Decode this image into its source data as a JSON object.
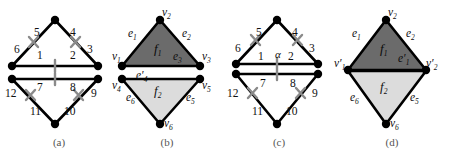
{
  "figure": {
    "width": 450,
    "height": 152,
    "background": "#ffffff"
  },
  "colors": {
    "edge_stroke": "#000000",
    "vertex_fill": "#000000",
    "tick_mark": "#808080",
    "face_f1_fill": "#6b6b6b",
    "face_f2_fill": "#dcdcdc",
    "caption_text": "#555555",
    "label_text": "#111111",
    "background": "#ffffff"
  },
  "panels": [
    {
      "id": "a",
      "caption": "(a)",
      "kind": "numbered-half-edges",
      "vertices": [
        {
          "name": "top",
          "x": 55,
          "y": 20
        },
        {
          "name": "left-upper",
          "x": 12,
          "y": 66
        },
        {
          "name": "right-upper",
          "x": 98,
          "y": 66
        },
        {
          "name": "left-lower",
          "x": 12,
          "y": 78
        },
        {
          "name": "right-lower",
          "x": 98,
          "y": 78
        },
        {
          "name": "bottom",
          "x": 55,
          "y": 124
        }
      ],
      "edge_labels": [
        {
          "text": "5",
          "x": 34,
          "y": 33
        },
        {
          "text": "4",
          "x": 70,
          "y": 33
        },
        {
          "text": "6",
          "x": 16,
          "y": 49
        },
        {
          "text": "3",
          "x": 87,
          "y": 49
        },
        {
          "text": "1",
          "x": 39,
          "y": 55
        },
        {
          "text": "2",
          "x": 70,
          "y": 55
        },
        {
          "text": "7",
          "x": 39,
          "y": 84
        },
        {
          "text": "8",
          "x": 70,
          "y": 84
        },
        {
          "text": "12",
          "x": 10,
          "y": 92
        },
        {
          "text": "9",
          "x": 90,
          "y": 92
        },
        {
          "text": "11",
          "x": 34,
          "y": 110
        },
        {
          "text": "10",
          "x": 68,
          "y": 110
        }
      ]
    },
    {
      "id": "b",
      "caption": "(b)",
      "kind": "shaded-faces",
      "faces": [
        {
          "name": "f1",
          "label": "f",
          "sub": "1",
          "fill": "#6b6b6b",
          "label_x": 46,
          "label_y": 48
        },
        {
          "name": "f2",
          "label": "f",
          "sub": "2",
          "fill": "#dcdcdc",
          "label_x": 46,
          "label_y": 90
        }
      ],
      "vertex_labels": [
        {
          "text": "v",
          "sub": "2",
          "prime": false,
          "x": 50,
          "y": 14
        },
        {
          "text": "v",
          "sub": "1",
          "prime": false,
          "x": 2,
          "y": 56
        },
        {
          "text": "v",
          "sub": "3",
          "prime": false,
          "x": 92,
          "y": 56
        },
        {
          "text": "v",
          "sub": "4",
          "prime": false,
          "x": 2,
          "y": 82
        },
        {
          "text": "v",
          "sub": "5",
          "prime": false,
          "x": 92,
          "y": 82
        },
        {
          "text": "v",
          "sub": "6",
          "prime": false,
          "x": 52,
          "y": 122
        }
      ],
      "edge_labels": [
        {
          "text": "e",
          "sub": "1",
          "prime": false,
          "x": 18,
          "y": 33
        },
        {
          "text": "e",
          "sub": "2",
          "prime": false,
          "x": 72,
          "y": 33
        },
        {
          "text": "e",
          "sub": "3",
          "prime": false,
          "x": 62,
          "y": 57
        },
        {
          "text": "e",
          "sub": "4",
          "prime": true,
          "x": 26,
          "y": 77
        },
        {
          "text": "e",
          "sub": "6",
          "prime": false,
          "x": 16,
          "y": 96
        },
        {
          "text": "e",
          "sub": "5",
          "prime": false,
          "x": 76,
          "y": 96
        }
      ]
    },
    {
      "id": "c",
      "caption": "(c)",
      "kind": "numbered-half-edges-alpha",
      "alpha_label": "α",
      "edge_labels": [
        {
          "text": "5",
          "x": 34,
          "y": 33
        },
        {
          "text": "4",
          "x": 70,
          "y": 33
        },
        {
          "text": "6",
          "x": 14,
          "y": 49
        },
        {
          "text": "3",
          "x": 86,
          "y": 49
        },
        {
          "text": "1",
          "x": 36,
          "y": 57
        },
        {
          "text": "2",
          "x": 66,
          "y": 57
        },
        {
          "text": "7",
          "x": 38,
          "y": 82
        },
        {
          "text": "8",
          "x": 68,
          "y": 82
        },
        {
          "text": "12",
          "x": 8,
          "y": 92
        },
        {
          "text": "9",
          "x": 90,
          "y": 92
        },
        {
          "text": "11",
          "x": 32,
          "y": 110
        },
        {
          "text": "10",
          "x": 66,
          "y": 110
        }
      ],
      "alpha_x": 57,
      "alpha_y": 55
    },
    {
      "id": "d",
      "caption": "(d)",
      "kind": "shaded-faces-primed",
      "faces": [
        {
          "name": "f1",
          "label": "f",
          "sub": "1",
          "fill": "#6b6b6b",
          "label_x": 50,
          "label_y": 48
        },
        {
          "name": "f2",
          "label": "f",
          "sub": "2",
          "fill": "#dcdcdc",
          "label_x": 50,
          "label_y": 86
        }
      ],
      "vertex_labels": [
        {
          "text": "v",
          "sub": "2",
          "prime": false,
          "x": 54,
          "y": 14
        },
        {
          "text": "v",
          "sub": "1",
          "prime": true,
          "x": 2,
          "y": 64
        },
        {
          "text": "v",
          "sub": "2",
          "prime": true,
          "x": 94,
          "y": 64
        },
        {
          "text": "v",
          "sub": "6",
          "prime": false,
          "x": 56,
          "y": 122
        }
      ],
      "edge_labels": [
        {
          "text": "e",
          "sub": "1",
          "prime": false,
          "x": 20,
          "y": 33
        },
        {
          "text": "e",
          "sub": "2",
          "prime": false,
          "x": 74,
          "y": 33
        },
        {
          "text": "e",
          "sub": "1",
          "prime": true,
          "x": 66,
          "y": 57
        },
        {
          "text": "e",
          "sub": "6",
          "prime": false,
          "x": 18,
          "y": 96
        },
        {
          "text": "e",
          "sub": "5",
          "prime": false,
          "x": 78,
          "y": 96
        }
      ]
    }
  ]
}
